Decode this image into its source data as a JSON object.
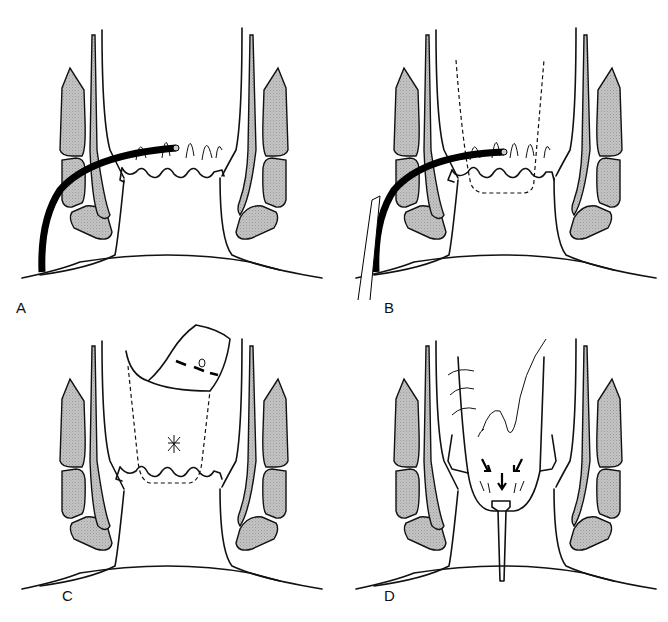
{
  "figure": {
    "panels": [
      {
        "id": "A",
        "label": "A",
        "description": "Catheter inserted through perianal skin toward dentate line region"
      },
      {
        "id": "B",
        "label": "B",
        "description": "Catheter with dashed outline of flap region above dentate line"
      },
      {
        "id": "C",
        "label": "C",
        "description": "Mucosal flap raised with dashed outline; suture marks"
      },
      {
        "id": "D",
        "label": "D",
        "description": "Flap advanced and sutured, drain in place with arrows"
      }
    ],
    "colors": {
      "line": "#111111",
      "muscle_fill": "#bdbdbd",
      "background": "#ffffff"
    }
  }
}
